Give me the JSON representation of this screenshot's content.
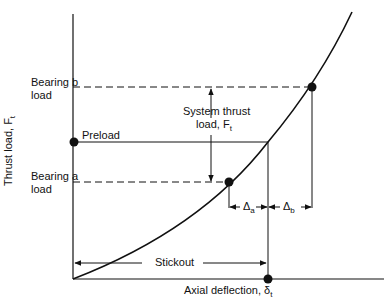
{
  "diagram": {
    "y_axis_label": "Thrust load, F",
    "y_axis_sub": "t",
    "x_axis_label": "Axial deflection, δ",
    "x_axis_sub": "t",
    "labels": {
      "bearing_b_line1": "Bearing b",
      "bearing_b_line2": "load",
      "bearing_a_line1": "Bearing a",
      "bearing_a_line2": "load",
      "preload": "Preload",
      "system_thrust_line1": "System thrust",
      "system_thrust_line2": "load, F",
      "system_thrust_sub": "t",
      "delta_a": "Δ",
      "delta_a_sub": "a",
      "delta_b": "Δ",
      "delta_b_sub": "b",
      "stickout": "Stickout"
    },
    "colors": {
      "line": "#111111",
      "background": "#ffffff"
    }
  }
}
